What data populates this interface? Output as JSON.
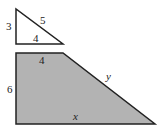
{
  "diagram": {
    "triangle": {
      "labels": {
        "vertical_side": "3",
        "hypotenuse": "5",
        "base": "4"
      }
    },
    "trapezoid": {
      "labels": {
        "height": "6",
        "top": "4",
        "slant": "y",
        "bottom": "x"
      },
      "fill_color": "#b3b3b3"
    }
  }
}
